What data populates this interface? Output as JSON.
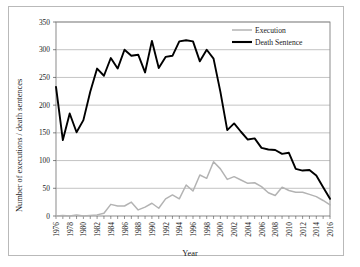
{
  "figure": {
    "background_color": "#ffffff",
    "frame_color": "#b9b9b9"
  },
  "chart_data": {
    "type": "line",
    "title": "",
    "xlabel": "Year",
    "ylabel": "Number of executions / death sentences",
    "xlim": [
      1976,
      2016
    ],
    "ylim": [
      0,
      350
    ],
    "yticks": [
      0,
      50,
      100,
      150,
      200,
      250,
      300,
      350
    ],
    "xticks": [
      1976,
      1978,
      1980,
      1982,
      1984,
      1986,
      1988,
      1990,
      1992,
      1994,
      1996,
      1998,
      2000,
      2002,
      2004,
      2006,
      2008,
      2010,
      2012,
      2014,
      2016
    ],
    "grid": "horizontal",
    "legend_position": "top-right",
    "x": [
      1976,
      1977,
      1978,
      1979,
      1980,
      1981,
      1982,
      1983,
      1984,
      1985,
      1986,
      1987,
      1988,
      1989,
      1990,
      1991,
      1992,
      1993,
      1994,
      1995,
      1996,
      1997,
      1998,
      1999,
      2000,
      2001,
      2002,
      2003,
      2004,
      2005,
      2006,
      2007,
      2008,
      2009,
      2010,
      2011,
      2012,
      2013,
      2014,
      2015,
      2016
    ],
    "series": [
      {
        "name": "Execution",
        "color": "#b3b3b3",
        "values": [
          0,
          1,
          0,
          2,
          0,
          1,
          2,
          5,
          21,
          18,
          18,
          25,
          11,
          16,
          23,
          14,
          31,
          38,
          31,
          56,
          45,
          74,
          68,
          98,
          85,
          66,
          71,
          65,
          59,
          60,
          53,
          42,
          37,
          52,
          46,
          43,
          43,
          39,
          35,
          28,
          20
        ]
      },
      {
        "name": "Death Sentence",
        "color": "#000000",
        "values": [
          233,
          137,
          185,
          151,
          173,
          224,
          266,
          253,
          285,
          266,
          300,
          289,
          291,
          259,
          316,
          267,
          287,
          289,
          315,
          317,
          315,
          279,
          300,
          284,
          224,
          155,
          167,
          152,
          138,
          140,
          123,
          120,
          119,
          112,
          114,
          85,
          82,
          83,
          73,
          52,
          31
        ]
      }
    ]
  },
  "legend": {
    "items": [
      {
        "label": "Execution",
        "color": "#b3b3b3"
      },
      {
        "label": "Death Sentence",
        "color": "#000000"
      }
    ]
  },
  "axes": {
    "y_title": "Number of executions / death sentences",
    "x_title": "Year",
    "y_tick_labels": [
      "350",
      "300",
      "250",
      "200",
      "150",
      "100",
      "50",
      "0"
    ],
    "x_tick_labels": [
      "1976",
      "1978",
      "1980",
      "1982",
      "1984",
      "1986",
      "1988",
      "1990",
      "1992",
      "1994",
      "1996",
      "1998",
      "2000",
      "2002",
      "2004",
      "2006",
      "2008",
      "2010",
      "2012",
      "2014",
      "2016"
    ]
  }
}
